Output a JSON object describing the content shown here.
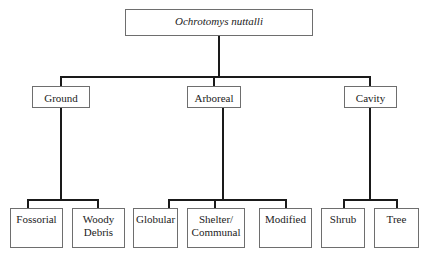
{
  "root": {
    "label": "Ochrotomys nuttalli"
  },
  "categories": [
    {
      "label": "Ground",
      "children": [
        {
          "label": "Fossorial"
        },
        {
          "label": "Woody Debris"
        }
      ]
    },
    {
      "label": "Arboreal",
      "children": [
        {
          "label": "Globular"
        },
        {
          "label": "Shelter/ Communal"
        },
        {
          "label": "Modified"
        }
      ]
    },
    {
      "label": "Cavity",
      "children": [
        {
          "label": "Shrub"
        },
        {
          "label": "Tree"
        }
      ]
    }
  ]
}
